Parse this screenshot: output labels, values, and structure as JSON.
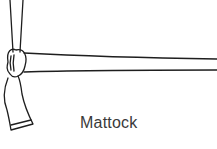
{
  "figure": {
    "caption": "Mattock",
    "stroke_color": "#1e1e1e",
    "caption_color": "#3a3a3a",
    "background": "#ffffff"
  }
}
